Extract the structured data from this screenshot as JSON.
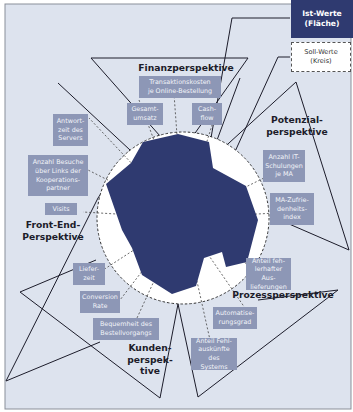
{
  "colors": {
    "background": "#dde3ee",
    "frame_border": "#8a8f99",
    "ist_fill": "#2f3a70",
    "soll_fill": "#ffffff",
    "label_box": "#8d97b6",
    "label_text": "#f2f4f9",
    "outline": "#1c1c2a"
  },
  "legend": {
    "ist": "Ist-Werte\n(Fläche)",
    "soll": "Soll-Werte\n(Kreis)"
  },
  "perspectives": {
    "finanz": "Finanzperspektive",
    "potenzial": "Potenzial-\nperspektive",
    "prozess": "Prozessperspektive",
    "kunden": "Kunden-\nperspek-\ntive",
    "frontend": "Front-End-\nPerspektive"
  },
  "indicators": {
    "transaktionskosten": "Transaktionskosten\nje Online-Bestellung",
    "gesamtumsatz": "Gesamt-\numsatz",
    "cashflow": "Cash-\nflow",
    "it_schulungen": "Anzahl IT-\nSchulungen\nje MA",
    "ma_zufriedenheit": "MA-Zufrie-\ndenheits-\nindex",
    "fehlerhafte_auslieferungen": "Anteil feh-\nlerhafter Aus-\nlieferungen",
    "automatisierungsgrad": "Automatise-\nrungsgrad",
    "fehlauskuenfte": "Anteil Fehl-\nauskünfte\ndes Systems",
    "bequemlichkeit": "Bequemheit des\nBestellvorgangs",
    "conversion_rate": "Conversion\nRate",
    "lieferzeit": "Liefer-\nzeit",
    "visits": "Visits",
    "besuche_kooperation": "Anzahl Besuche\nüber Links der\nKooperations-\npartner",
    "antwortzeit": "Antwort-\nzeit des\nServers"
  }
}
